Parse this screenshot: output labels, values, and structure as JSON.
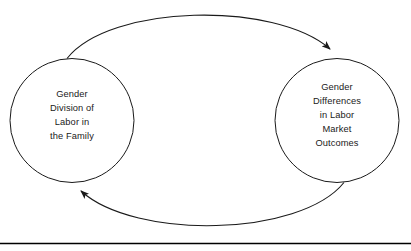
{
  "diagram": {
    "type": "feedback-loop",
    "title": "",
    "background_color": "#ffffff",
    "stroke_color": "#1a1a1a",
    "text_color": "#1a1a1a",
    "nodes": [
      {
        "id": "left",
        "shape": "circle",
        "label": "Gender\nDivision of\nLabor in\nthe Family",
        "lines": [
          "Gender",
          "Division of",
          "Labor in",
          "the Family"
        ],
        "center_x": 72,
        "center_y": 120,
        "radius": 62
      },
      {
        "id": "right",
        "shape": "circle",
        "label": "Gender\nDifferences\nin Labor\nMarket\nOutcomes",
        "lines": [
          "Gender",
          "Differences",
          "in Labor",
          "Market",
          "Outcomes"
        ],
        "center_x": 337,
        "center_y": 120,
        "radius": 62
      }
    ],
    "arrows": [
      {
        "id": "top-arrow",
        "from": "left",
        "to": "right",
        "direction": "left-to-right",
        "curve": "arc-over-top",
        "arrowhead": "end"
      },
      {
        "id": "bottom-arrow",
        "from": "right",
        "to": "left",
        "direction": "right-to-left",
        "curve": "arc-under-bottom",
        "arrowhead": "end"
      }
    ],
    "footer_rule": {
      "label": "horizontal-rule",
      "y": 243,
      "color": "#000000"
    }
  }
}
